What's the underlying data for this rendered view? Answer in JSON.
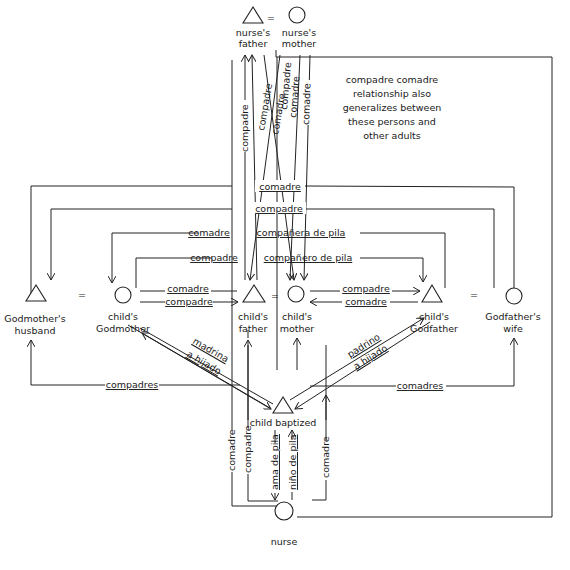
{
  "nodes": {
    "nurses_father": {
      "label1": "nurse's",
      "label2": "father",
      "sex": "male"
    },
    "nurses_mother": {
      "label1": "nurse's",
      "label2": "mother",
      "sex": "female"
    },
    "godmothers_husband": {
      "label1": "Godmother's",
      "label2": "husband",
      "sex": "male"
    },
    "childs_godmother": {
      "label1": "child's",
      "label2": "Godmother",
      "sex": "female"
    },
    "childs_father": {
      "label1": "child's",
      "label2": "father",
      "sex": "male"
    },
    "childs_mother": {
      "label1": "child's",
      "label2": "mother",
      "sex": "female"
    },
    "childs_godfather": {
      "label1": "child's",
      "label2": "Godfather",
      "sex": "male"
    },
    "godfathers_wife": {
      "label1": "Godfather's",
      "label2": "wife",
      "sex": "female"
    },
    "child_baptized": {
      "label1": "child baptized",
      "sex": "male"
    },
    "nurse": {
      "label1": "nurse",
      "sex": "female"
    }
  },
  "marriage_sign": "=",
  "note": {
    "lines": [
      "compadre  comadre",
      "relationship  also",
      "generalizes between",
      "these persons and",
      "other adults"
    ]
  },
  "edge_labels": {
    "top_verticals": [
      "compadre",
      "compadre",
      "comadre",
      "compadre",
      "comadre",
      "comadre"
    ],
    "horizontal_1": "comadre",
    "horizontal_2": "compadre",
    "horizontal_3a": "comadre",
    "horizontal_3b": "compañera de pila",
    "horizontal_4a": "compadre",
    "horizontal_4b": "compañero de pila",
    "gm_to_father_top": "comadre",
    "gm_to_father_bottom": "compadre",
    "mother_to_gf_top": "compadre",
    "mother_to_gf_bottom": "comadre",
    "madrina": "madrina",
    "a_hijado_left": "a hijado",
    "padrino": "padrino",
    "a_hijado_right": "a hijado",
    "compadres_left": "compadres",
    "comadres_right": "comadres",
    "nurse_comadre_left": "comadre",
    "nurse_compadre": "compadre",
    "ama_de_pila": "ama de pila",
    "nino_de_pila": "niño de pila",
    "nurse_comadre_right": "comadre"
  }
}
